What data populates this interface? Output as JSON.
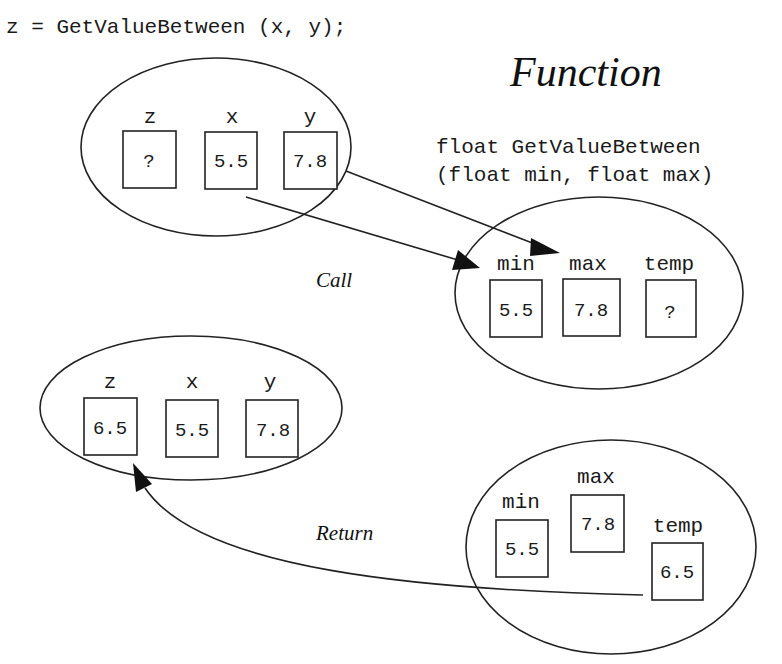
{
  "header": {
    "statement": "z = GetValueBetween (x, y);"
  },
  "function_title": "Function",
  "signature": {
    "line1": "float GetValueBetween",
    "line2": "(float min, float max)"
  },
  "labels": {
    "call": "Call",
    "return": "Return"
  },
  "caller_before": {
    "vars": [
      {
        "name": "z",
        "value": "?"
      },
      {
        "name": "x",
        "value": "5.5"
      },
      {
        "name": "y",
        "value": "7.8"
      }
    ]
  },
  "callee_call": {
    "vars": [
      {
        "name": "min",
        "value": "5.5"
      },
      {
        "name": "max",
        "value": "7.8"
      },
      {
        "name": "temp",
        "value": "?"
      }
    ]
  },
  "caller_after": {
    "vars": [
      {
        "name": "z",
        "value": "6.5"
      },
      {
        "name": "x",
        "value": "5.5"
      },
      {
        "name": "y",
        "value": "7.8"
      }
    ]
  },
  "callee_return": {
    "vars": [
      {
        "name": "min",
        "value": "5.5"
      },
      {
        "name": "max",
        "value": "7.8"
      },
      {
        "name": "temp",
        "value": "6.5"
      }
    ]
  }
}
